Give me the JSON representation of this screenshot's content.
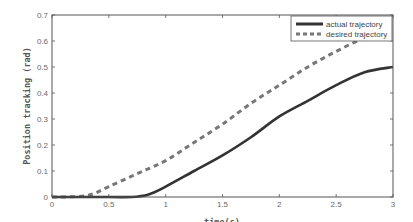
{
  "chart_data": {
    "type": "line",
    "title": "",
    "xlabel": "time(s)",
    "ylabel": "Position tracking (rad)",
    "xlim": [
      0,
      3
    ],
    "ylim": [
      0,
      0.7
    ],
    "xticks": [
      "0",
      "0.5",
      "1",
      "1.5",
      "2",
      "2.5",
      "3"
    ],
    "yticks": [
      "0",
      "0.1",
      "0.2",
      "0.3",
      "0.4",
      "0.5",
      "0.6",
      "0.7"
    ],
    "grid": false,
    "legend_position": "upper right",
    "series": [
      {
        "name": "actual trajectory",
        "style": "solid",
        "color": "#333333",
        "x": [
          0,
          0.5,
          0.7,
          0.85,
          1.0,
          1.25,
          1.5,
          1.75,
          2.0,
          2.25,
          2.5,
          2.75,
          3.0
        ],
        "values": [
          0,
          0,
          0,
          0.01,
          0.04,
          0.1,
          0.16,
          0.23,
          0.31,
          0.37,
          0.43,
          0.48,
          0.5
        ]
      },
      {
        "name": "desired trajectory",
        "style": "dashed",
        "color": "#777777",
        "x": [
          0,
          0.3,
          0.5,
          0.75,
          1.0,
          1.25,
          1.5,
          1.75,
          2.0,
          2.25,
          2.5,
          2.75,
          3.0
        ],
        "values": [
          0,
          0.005,
          0.04,
          0.09,
          0.14,
          0.21,
          0.28,
          0.36,
          0.43,
          0.5,
          0.56,
          0.61,
          0.63
        ]
      }
    ]
  }
}
